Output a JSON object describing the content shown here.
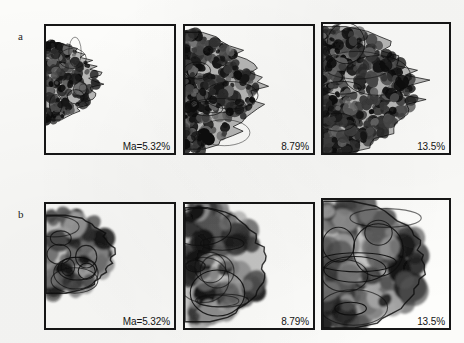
{
  "figure": {
    "kind": "scientific-figure",
    "background_color": "#fbfbf9",
    "ink_color": "#161616",
    "width": 464,
    "height": 343,
    "rows": [
      {
        "label": "a",
        "label_x": 18,
        "label_y": 30,
        "panels": [
          {
            "pct_label": "Ma=5.32%",
            "x": 44,
            "y": 24,
            "w": 132,
            "h": 131,
            "border_width": 2,
            "cluster": {
              "style": "sparse-dendritic",
              "fill_fraction": 0.16,
              "seed": 11,
              "attach_edge": "left",
              "extent_x": 0.4,
              "extent_y_top": 0.13,
              "extent_y_bottom": 0.74,
              "blob_count": 150,
              "blob_radius": [
                2.0,
                5.4
              ]
            }
          },
          {
            "pct_label": "8.79%",
            "x": 183,
            "y": 24,
            "w": 132,
            "h": 131,
            "border_width": 2,
            "cluster": {
              "style": "medium-dendritic",
              "fill_fraction": 0.32,
              "seed": 29,
              "attach_edge": "left",
              "extent_x": 0.56,
              "extent_y_top": 0.05,
              "extent_y_bottom": 0.97,
              "blob_count": 290,
              "blob_radius": [
                2.2,
                6.2
              ]
            }
          },
          {
            "pct_label": "13.5%",
            "x": 321,
            "y": 22,
            "w": 130,
            "h": 133,
            "border_width": 2,
            "cluster": {
              "style": "dense-dendritic",
              "fill_fraction": 0.5,
              "seed": 47,
              "attach_edge": "left",
              "extent_x": 0.74,
              "extent_y_top": 0.02,
              "extent_y_bottom": 1.0,
              "blob_count": 420,
              "blob_radius": [
                2.4,
                6.8
              ]
            }
          }
        ]
      },
      {
        "label": "b",
        "label_x": 18,
        "label_y": 208,
        "panels": [
          {
            "pct_label": "Ma=5.32%",
            "x": 44,
            "y": 202,
            "w": 132,
            "h": 128,
            "border_width": 2,
            "cluster": {
              "style": "compact-blob",
              "fill_fraction": 0.26,
              "seed": 61,
              "attach_edge": "left",
              "extent_x": 0.52,
              "extent_y_top": 0.09,
              "extent_y_bottom": 0.72,
              "blob_count": 70,
              "blob_radius": [
                5.0,
                12.0
              ]
            }
          },
          {
            "pct_label": "8.79%",
            "x": 183,
            "y": 202,
            "w": 132,
            "h": 128,
            "border_width": 2,
            "cluster": {
              "style": "compact-blob",
              "fill_fraction": 0.4,
              "seed": 83,
              "attach_edge": "left",
              "extent_x": 0.62,
              "extent_y_top": 0.03,
              "extent_y_bottom": 0.95,
              "blob_count": 95,
              "blob_radius": [
                5.5,
                13.0
              ]
            }
          },
          {
            "pct_label": "13.5%",
            "x": 321,
            "y": 198,
            "w": 130,
            "h": 132,
            "border_width": 2,
            "cluster": {
              "style": "compact-blob",
              "fill_fraction": 0.58,
              "seed": 101,
              "attach_edge": "left",
              "extent_x": 0.8,
              "extent_y_top": 0.01,
              "extent_y_bottom": 1.0,
              "blob_count": 120,
              "blob_radius": [
                6.0,
                15.0
              ]
            }
          }
        ]
      }
    ]
  }
}
